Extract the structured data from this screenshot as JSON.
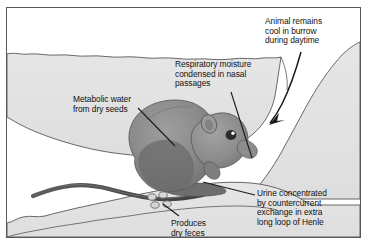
{
  "figure": {
    "frame_color": "#58585a",
    "background_color": "#ffffff",
    "soil_color": "#e3e3e3",
    "soil_outline_color": "#58585a",
    "animal_body_color": "#8d8d8d",
    "animal_shadow_color": "#6a6a6a",
    "leader_line_color": "#1a1a1a"
  },
  "labels": {
    "animal_cool": "Animal remains\ncool in burrow\nduring daytime",
    "respiratory": "Respiratory moisture\ncondensed in nasal\npassages",
    "metabolic": "Metabolic water\nfrom dry seeds",
    "urine": "Urine concentrated\nby countercurrent\nexchange in extra\nlong loop of Henle",
    "feces": "Produces\ndry feces"
  },
  "illustration_parts": {
    "ground_surface": "wavy-ground-line",
    "burrow_chamber": "white-cavity",
    "animal": "kangaroo-rat",
    "tail": "long-wavy-tail",
    "feces_pellets": 4,
    "arrow": "curved-arrow-into-burrow"
  }
}
